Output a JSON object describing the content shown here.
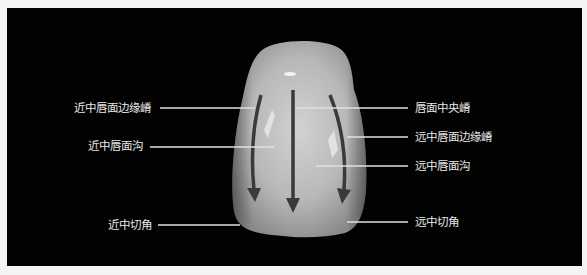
{
  "figure": {
    "title": "",
    "colors": {
      "background": "#020202",
      "frame": "#f4f4f4",
      "label_text": "#e8e8e8",
      "leader_line": "#e0e0e0",
      "arrow": "#3a3a3a"
    }
  },
  "labels": {
    "left": [
      {
        "id": "mesial-labial-marginal-ridge",
        "text": "近中唇面边缘嵴"
      },
      {
        "id": "mesial-labial-groove",
        "text": "近中唇面沟"
      },
      {
        "id": "mesial-incisal-angle",
        "text": "近中切角"
      }
    ],
    "right": [
      {
        "id": "labial-central-ridge",
        "text": "唇面中央嵴"
      },
      {
        "id": "distal-labial-marginal-ridge",
        "text": "远中唇面边缘嵴"
      },
      {
        "id": "distal-labial-groove",
        "text": "远中唇面沟"
      },
      {
        "id": "distal-incisal-angle",
        "text": "远中切角"
      }
    ]
  },
  "arrows": [
    {
      "id": "mesial-arrow",
      "direction": "down"
    },
    {
      "id": "central-arrow",
      "direction": "down"
    },
    {
      "id": "distal-arrow",
      "direction": "down"
    }
  ]
}
